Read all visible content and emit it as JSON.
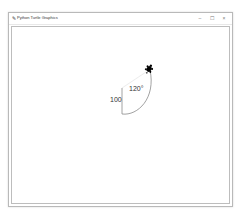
{
  "window": {
    "title": "Python Turtle Graphics",
    "icon": "feather-icon",
    "controls": {
      "minimize": "–",
      "maximize": "☐",
      "close": "×"
    }
  },
  "canvas": {
    "labels": {
      "side_length": "100",
      "angle": "120°"
    },
    "turtle": {
      "shape": "turtle",
      "color": "#000000"
    },
    "pen_color": "#8a8a8a"
  }
}
